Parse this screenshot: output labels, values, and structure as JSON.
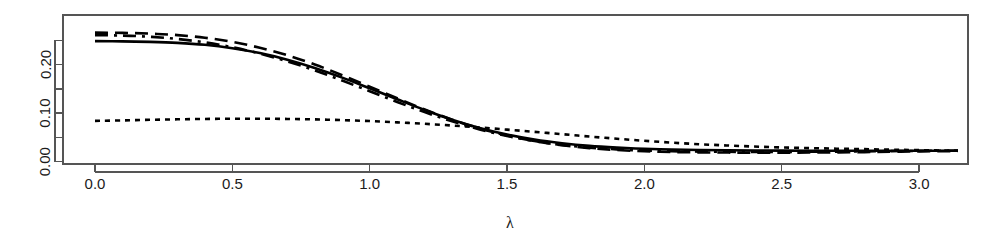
{
  "chart_data": {
    "type": "line",
    "title": "",
    "subtitle": "",
    "xlabel": "λ",
    "ylabel": "",
    "xlim": [
      0,
      3.1416
    ],
    "ylim": [
      0,
      0.2675
    ],
    "grid": false,
    "legend": "none",
    "background": "#ffffff",
    "foreground": "#000000",
    "axis_color": "#555555",
    "box_border": true,
    "x_ticks": [
      {
        "value": 0.0,
        "label": "0.0",
        "major": true
      },
      {
        "value": 0.5,
        "label": "0.5",
        "major": true
      },
      {
        "value": 1.0,
        "label": "1.0",
        "major": true
      },
      {
        "value": 1.5,
        "label": "1.5",
        "major": true
      },
      {
        "value": 2.0,
        "label": "2.0",
        "major": true
      },
      {
        "value": 2.5,
        "label": "2.5",
        "major": true
      },
      {
        "value": 3.0,
        "label": "3.0",
        "major": true
      }
    ],
    "y_ticks": [
      {
        "value": 0.0,
        "label": "0.00",
        "major": true
      },
      {
        "value": 0.05,
        "label": "",
        "major": false
      },
      {
        "value": 0.1,
        "label": "0.10",
        "major": true
      },
      {
        "value": 0.15,
        "label": "",
        "major": false
      },
      {
        "value": 0.2,
        "label": "0.20",
        "major": true
      },
      {
        "value": 0.25,
        "label": "",
        "major": false
      }
    ],
    "x": [
      0.0,
      0.1,
      0.2,
      0.3,
      0.4,
      0.5,
      0.6,
      0.7,
      0.8,
      0.9,
      1.0,
      1.1,
      1.2,
      1.3,
      1.4,
      1.5,
      1.6,
      1.7,
      1.8,
      1.9,
      2.0,
      2.1,
      2.2,
      2.3,
      2.4,
      2.5,
      2.6,
      2.7,
      2.8,
      2.9,
      3.0,
      3.1416
    ],
    "series": [
      {
        "name": "solid",
        "linetype": "solid",
        "dasharray": "none",
        "values": [
          0.248,
          0.2475,
          0.2465,
          0.2445,
          0.2405,
          0.2335,
          0.2235,
          0.21,
          0.193,
          0.173,
          0.151,
          0.1285,
          0.1065,
          0.0865,
          0.0695,
          0.056,
          0.0455,
          0.038,
          0.0325,
          0.029,
          0.0265,
          0.025,
          0.024,
          0.0235,
          0.023,
          0.0228,
          0.0226,
          0.0225,
          0.0224,
          0.0224,
          0.0224,
          0.0224
        ]
      },
      {
        "name": "long-dashed",
        "linetype": "dashed",
        "dasharray": "13 7",
        "values": [
          0.2655,
          0.265,
          0.2635,
          0.2605,
          0.255,
          0.2465,
          0.2345,
          0.219,
          0.2,
          0.178,
          0.1545,
          0.1305,
          0.1075,
          0.0865,
          0.0685,
          0.054,
          0.0425,
          0.034,
          0.028,
          0.024,
          0.0215,
          0.02,
          0.0192,
          0.0188,
          0.0186,
          0.0186,
          0.0188,
          0.0192,
          0.0198,
          0.0205,
          0.0212,
          0.022
        ]
      },
      {
        "name": "dash-dot",
        "linetype": "dashdot",
        "dasharray": "13 6 3 6",
        "values": [
          0.2605,
          0.2595,
          0.257,
          0.2525,
          0.2455,
          0.2355,
          0.2225,
          0.2065,
          0.188,
          0.167,
          0.145,
          0.123,
          0.102,
          0.083,
          0.0665,
          0.053,
          0.0425,
          0.0345,
          0.029,
          0.0253,
          0.023,
          0.0216,
          0.0208,
          0.0204,
          0.0202,
          0.0202,
          0.0204,
          0.0208,
          0.0213,
          0.0218,
          0.0222,
          0.0228
        ]
      },
      {
        "name": "dotted",
        "linetype": "dotted",
        "dasharray": "5 5",
        "values": [
          0.084,
          0.085,
          0.0862,
          0.0872,
          0.088,
          0.0884,
          0.0884,
          0.088,
          0.087,
          0.0856,
          0.0836,
          0.081,
          0.078,
          0.0744,
          0.0704,
          0.066,
          0.0614,
          0.0566,
          0.0518,
          0.0472,
          0.043,
          0.0392,
          0.036,
          0.0334,
          0.0312,
          0.0294,
          0.028,
          0.0268,
          0.0258,
          0.0248,
          0.0238,
          0.0226
        ]
      }
    ],
    "annotations": []
  },
  "layout": {
    "plot_left": 63,
    "plot_right": 968,
    "plot_top": 15,
    "plot_bottom": 164,
    "x_axis_y": 172,
    "y_axis_x": 55,
    "xlabel_x": 510,
    "xlabel_y": 228
  }
}
